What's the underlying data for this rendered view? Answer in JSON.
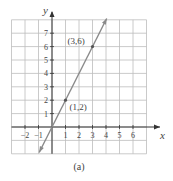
{
  "chart_data": {
    "type": "line",
    "title": "",
    "caption": "(a)",
    "xlabel": "x",
    "ylabel": "y",
    "xlim": [
      -3,
      7
    ],
    "ylim": [
      -2,
      8
    ],
    "grid": true,
    "x_ticks": [
      -2,
      -1,
      1,
      2,
      3,
      4,
      5,
      6
    ],
    "x_tick_labels": [
      "−2",
      "−1",
      "1",
      "2",
      "3",
      "4",
      "5",
      "6"
    ],
    "y_ticks": [
      1,
      2,
      3,
      4,
      5,
      6,
      7
    ],
    "y_tick_labels": [
      "1",
      "2",
      "3",
      "4",
      "5",
      "6",
      "7"
    ],
    "series": [
      {
        "name": "y = 2x",
        "equation": "y = 2x",
        "color": "#8a8a8a",
        "x": [
          -0.95,
          4.05
        ],
        "y": [
          -1.9,
          8.1
        ],
        "arrows": "both"
      }
    ],
    "points": [
      {
        "x": 1,
        "y": 2,
        "label": "(1, 2)"
      },
      {
        "x": 3,
        "y": 6,
        "label": "(3, 6)"
      }
    ]
  },
  "colors": {
    "grid": "#bdbdbd",
    "axis": "#333333",
    "line": "#8a8a8a",
    "text": "#444444"
  }
}
